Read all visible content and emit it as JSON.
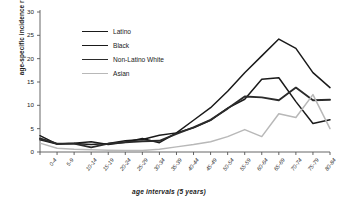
{
  "chart_data": {
    "type": "line",
    "title": "",
    "subtitle": "",
    "xlabel": "age intervals (5 years)",
    "ylabel": "age-specific incidence rate",
    "categories": [
      "0-4",
      "5-9",
      "10-14",
      "15-19",
      "20-24",
      "25-29",
      "30-34",
      "35-39",
      "40-44",
      "45-49",
      "50-54",
      "55-59",
      "60-64",
      "65-69",
      "70-74",
      "75-79",
      "80-84",
      "85+"
    ],
    "ylim": [
      0,
      30
    ],
    "yticks": [
      0,
      5,
      10,
      15,
      20,
      25,
      30
    ],
    "grid": false,
    "legend_position": "upper-left-inside",
    "series": [
      {
        "name": "Latino",
        "color": "#1a1a1a",
        "width": 1.5,
        "values": [
          2.6,
          1.7,
          1.8,
          1.6,
          1.8,
          2.4,
          2.7,
          3.6,
          4.1,
          6.8,
          9.5,
          13.0,
          17.0,
          20.6,
          24.2,
          22.2,
          17.0,
          13.8
        ]
      },
      {
        "name": "Black",
        "color": "#1a1a1a",
        "width": 1.5,
        "values": [
          3.5,
          1.7,
          1.9,
          2.2,
          1.6,
          2.1,
          2.9,
          2.0,
          4.1,
          5.2,
          6.8,
          9.4,
          11.3,
          15.6,
          15.9,
          10.8,
          6.1,
          6.9
        ]
      },
      {
        "name": "Non-Latino White",
        "color": "#2b2b2b",
        "width": 1.9,
        "values": [
          2.9,
          1.8,
          1.8,
          1.0,
          1.8,
          2.1,
          2.3,
          2.4,
          3.9,
          5.3,
          6.9,
          9.3,
          11.9,
          11.7,
          11.1,
          13.8,
          11.1,
          11.2
        ]
      },
      {
        "name": "Asian",
        "color": "#b8b8b8",
        "width": 1.5,
        "values": [
          1.9,
          0.8,
          0.6,
          0.5,
          0.4,
          0.3,
          0.3,
          0.6,
          1.1,
          1.6,
          2.2,
          3.3,
          4.8,
          3.3,
          8.2,
          7.4,
          12.3,
          5.0
        ]
      }
    ]
  },
  "legend": {
    "items": [
      {
        "label": "Latino"
      },
      {
        "label": "Black"
      },
      {
        "label": "Non-Latino White"
      },
      {
        "label": "Asian"
      }
    ]
  }
}
